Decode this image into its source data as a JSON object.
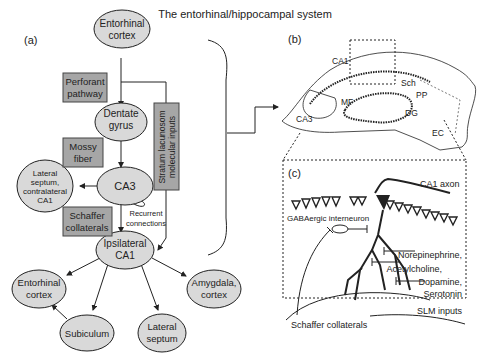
{
  "title": "The entorhinal/hippocampal system",
  "panel_a": {
    "label": "(a)",
    "nodes": {
      "entorhinal_top": [
        "Entorhinal",
        "cortex"
      ],
      "dentate": [
        "Dentate",
        "gyrus"
      ],
      "ca3": [
        "CA3"
      ],
      "lateral_contra": [
        "Lateral",
        "septum,",
        "contralateral",
        "CA1"
      ],
      "ipsi_ca1": [
        "Ipsilateral",
        "CA1"
      ],
      "entorhinal_bottom": [
        "Entorhinal",
        "cortex"
      ],
      "subiculum": [
        "Subiculum"
      ],
      "lateral_septum": [
        "Lateral",
        "septum"
      ],
      "amygdala": [
        "Amygdala,",
        "cortex"
      ]
    },
    "pathways": {
      "perforant": [
        "Perforant",
        "pathway"
      ],
      "mossy": [
        "Mossy",
        "fiber"
      ],
      "schaffer": [
        "Schaffer",
        "collaterals"
      ],
      "stratum": [
        "Stratum lacunosom",
        "molecular inputs"
      ]
    },
    "recurrent": [
      "Recurrent",
      "connections"
    ]
  },
  "panel_b": {
    "label": "(b)",
    "labels": {
      "ca1": "CA1",
      "sch": "Sch",
      "pp": "PP",
      "mf": "MF",
      "dg": "DG",
      "ca3": "CA3",
      "ec": "EC"
    }
  },
  "panel_c": {
    "label": "(c)",
    "labels": {
      "ca1_axon": "CA1 axon",
      "gaba": "GABAergic interneuron",
      "norepinephrine": "Norepinephrine,",
      "acetylcholine": "Acetylcholine,",
      "dopamine": "Dopamine,",
      "serotonin": "Serotonin",
      "slm": "SLM inputs",
      "schaffer": "Schaffer collaterals"
    }
  },
  "colors": {
    "node_fill": "#d9d9d9",
    "box_fill": "#a6a6a6",
    "stroke": "#222222"
  }
}
